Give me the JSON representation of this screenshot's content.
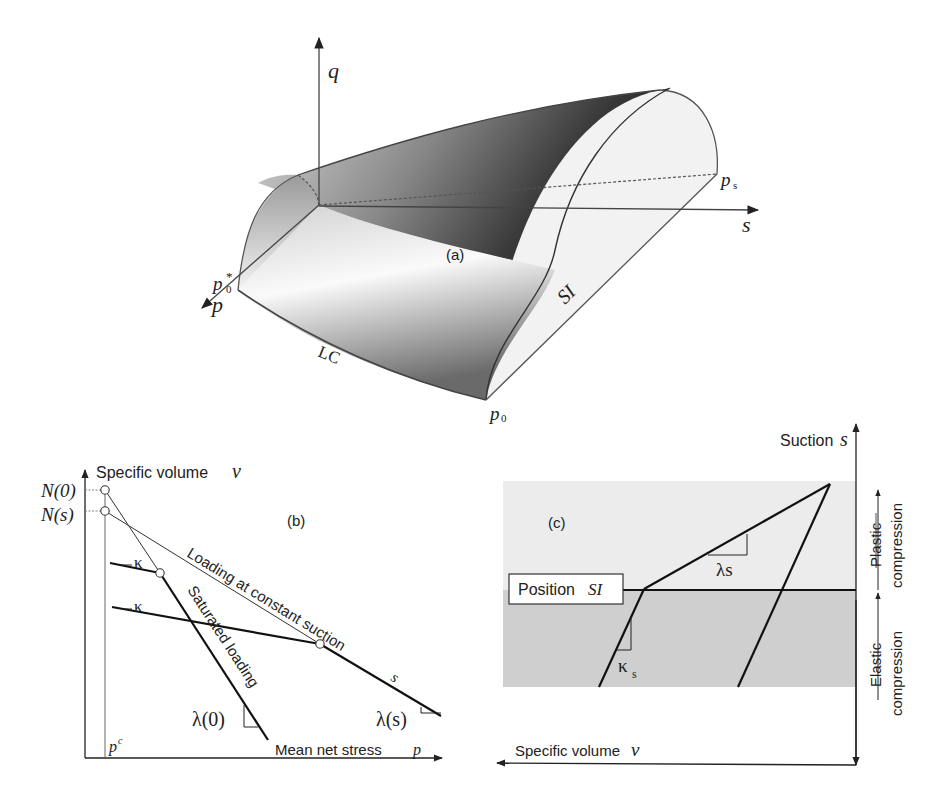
{
  "panel_a": {
    "label": "(a)",
    "axes": {
      "q": "q",
      "s": "s",
      "p": "p"
    },
    "points": {
      "p0_star": "p",
      "p0_star_sub": "0",
      "p0_star_sup": "*",
      "p0": "p",
      "p0_sub": "0",
      "ps": "p",
      "ps_sub": "s"
    },
    "curves": {
      "lc": "LC",
      "si": "SI"
    },
    "colors": {
      "surface_dark": "#2a2a2a",
      "surface_light": "#f4f4f4",
      "edge": "#555555"
    }
  },
  "panel_b": {
    "label": "(b)",
    "y_axis_label": "Specific volume",
    "y_axis_symbol": "v",
    "x_axis_label": "Mean net stress",
    "x_axis_symbol": "p",
    "pc_label": "p",
    "pc_sup": "c",
    "n0_label": "N(0)",
    "ns_label": "N(s)",
    "kappa_label_1": "κ",
    "kappa_label_2": "κ",
    "line_constant_suction": "Loading at constant suction",
    "line_constant_suction_sym": "s",
    "line_saturated": "Saturated loading",
    "lambda0_label": "λ(0)",
    "lambdas_label": "λ(s)"
  },
  "panel_c": {
    "label": "(c)",
    "y_axis_label": "Suction",
    "y_axis_symbol": "s",
    "x_axis_label": "Specific volume",
    "x_axis_symbol": "v",
    "position_box_text": "Position",
    "position_box_sym": "SI",
    "lambda_label": "λs",
    "kappa_label": "κ",
    "kappa_sub": "s",
    "plastic_label_1": "Plastic",
    "plastic_label_2": "compression",
    "elastic_label_1": "Elastic",
    "elastic_label_2": "compression",
    "colors": {
      "upper_band": "#ececec",
      "lower_band": "#cfcfcf"
    }
  }
}
